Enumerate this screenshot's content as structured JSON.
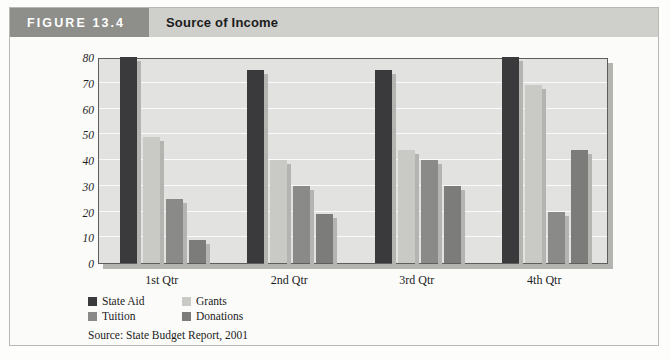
{
  "header": {
    "figure_tag": "FIGURE 13.4",
    "title": "Source of Income",
    "tag_bg": "#8e8e8a",
    "band_bg": "#cfcfcb"
  },
  "source_note": "Source: State Budget Report, 2001",
  "legend": {
    "items": [
      {
        "label": "State Aid",
        "color": "#3a3a3c"
      },
      {
        "label": "Grants",
        "color": "#c9c9c6"
      },
      {
        "label": "Tuition",
        "color": "#8a8a88"
      },
      {
        "label": "Donations",
        "color": "#7c7c7a"
      }
    ]
  },
  "chart_data": {
    "type": "bar",
    "title": "Source of Income",
    "xlabel": "",
    "ylabel": "",
    "ylim": [
      0,
      80
    ],
    "yticks": [
      0,
      10,
      20,
      30,
      40,
      50,
      60,
      70,
      80
    ],
    "grid": true,
    "legend_position": "bottom-left",
    "categories": [
      "1st Qtr",
      "2nd Qtr",
      "3rd Qtr",
      "4th Qtr"
    ],
    "series": [
      {
        "name": "State Aid",
        "color": "#3a3a3c",
        "values": [
          80,
          75,
          75,
          80
        ]
      },
      {
        "name": "Grants",
        "color": "#c9c9c6",
        "values": [
          49,
          40,
          44,
          69
        ]
      },
      {
        "name": "Tuition",
        "color": "#8a8a88",
        "values": [
          25,
          30,
          40,
          20
        ]
      },
      {
        "name": "Donations",
        "color": "#7c7c7a",
        "values": [
          9,
          19,
          30,
          44
        ]
      }
    ]
  }
}
